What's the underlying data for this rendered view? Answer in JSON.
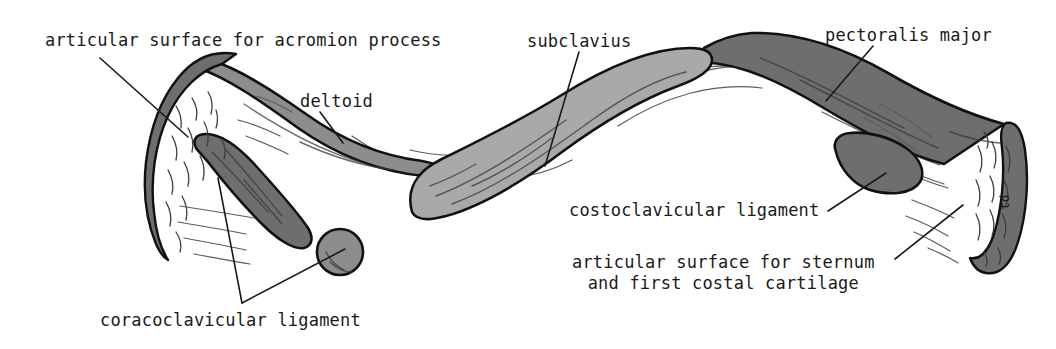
{
  "figure": {
    "background_color": "#ffffff",
    "ink_color": "#1a1a1a"
  },
  "palette": {
    "bone_fill": "#ffffff",
    "outline": "#111111",
    "muscle_dark": "#6e6e6e",
    "muscle_mid": "#8d8d8d",
    "muscle_light": "#a9a9a9",
    "hatch": "#5c5c5c"
  },
  "labels": [
    {
      "id": "articular-acromion",
      "text": "articular surface for acromion process",
      "x": 45,
      "y": 30,
      "leader_from": [
        100,
        58
      ],
      "leader_to": [
        188,
        137
      ]
    },
    {
      "id": "deltoid",
      "text": "deltoid",
      "x": 300,
      "y": 91,
      "leader_from": [
        320,
        112
      ],
      "leader_to": [
        343,
        143
      ]
    },
    {
      "id": "subclavius",
      "text": "subclavius",
      "x": 527,
      "y": 31,
      "leader_from": [
        579,
        52
      ],
      "leader_to": [
        545,
        166
      ]
    },
    {
      "id": "pectoralis-major",
      "text": "pectoralis major",
      "x": 825,
      "y": 25,
      "leader_from": [
        873,
        46
      ],
      "leader_to": [
        826,
        101
      ]
    },
    {
      "id": "costoclavicular-ligament",
      "text": "costoclavicular ligament",
      "x": 569,
      "y": 200,
      "leader_from": [
        828,
        211
      ],
      "leader_to": [
        886,
        173
      ]
    },
    {
      "id": "articular-sternum",
      "text": "articular surface for sternum\nand first costal cartilage",
      "x": 572,
      "y": 252,
      "leader_from": [
        895,
        259
      ],
      "leader_to": [
        963,
        205
      ]
    },
    {
      "id": "coracoclavicular-ligament",
      "text": "coracoclavicular ligament",
      "x": 100,
      "y": 310,
      "leader_from": [
        242,
        303
      ],
      "leader_to_a": [
        218,
        178
      ],
      "leader_to_b": [
        345,
        249
      ]
    },
    {
      "id": "td-mark",
      "text": "td",
      "x": 990,
      "y": 215,
      "rotated": true
    }
  ],
  "regions": [
    {
      "id": "articular-surface-acromial",
      "label": "articular surface for acromion process",
      "shading": "stippled",
      "color": "#ffffff"
    },
    {
      "id": "deltoid-attachment",
      "label": "deltoid",
      "shading": "solid",
      "color": "#8d8d8d"
    },
    {
      "id": "trapezoid-line",
      "label": "coracoclavicular ligament (trapezoid line)",
      "shading": "solid",
      "color": "#6e6e6e"
    },
    {
      "id": "conoid-tubercle",
      "label": "coracoclavicular ligament (conoid tubercle)",
      "shading": "solid",
      "color": "#8d8d8d"
    },
    {
      "id": "subclavius-groove",
      "label": "subclavius",
      "shading": "solid",
      "color": "#a9a9a9"
    },
    {
      "id": "pectoralis-major-attachment",
      "label": "pectoralis major",
      "shading": "solid",
      "color": "#6e6e6e"
    },
    {
      "id": "costoclavicular-impression",
      "label": "costoclavicular ligament",
      "shading": "solid",
      "color": "#6e6e6e"
    },
    {
      "id": "articular-surface-sternal",
      "label": "articular surface for sternum and first costal cartilage",
      "shading": "stippled",
      "color": "#ffffff"
    }
  ]
}
